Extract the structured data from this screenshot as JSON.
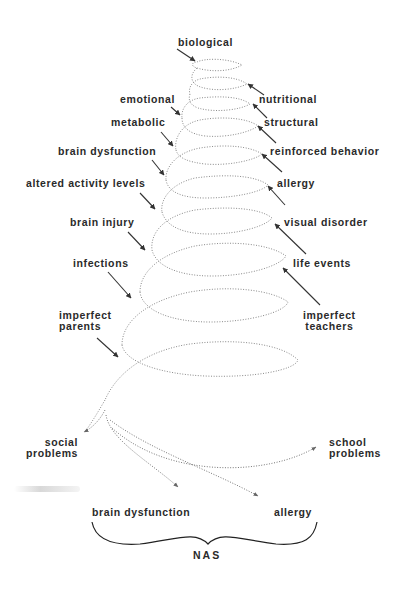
{
  "figure": {
    "type": "spiral-diagram",
    "converging_factors_left": [
      {
        "id": "biological",
        "label": "biological"
      },
      {
        "id": "emotional",
        "label": "emotional"
      },
      {
        "id": "metabolic",
        "label": "metabolic"
      },
      {
        "id": "brain-dysfunction-top",
        "label": "brain dysfunction"
      },
      {
        "id": "altered-activity",
        "label": "altered activity levels"
      },
      {
        "id": "brain-injury",
        "label": "brain injury"
      },
      {
        "id": "infections",
        "label": "infections"
      },
      {
        "id": "imperfect-parents",
        "label": "imperfect\nparents"
      }
    ],
    "converging_factors_right": [
      {
        "id": "nutritional",
        "label": "nutritional"
      },
      {
        "id": "structural",
        "label": "structural"
      },
      {
        "id": "reinforced-behavior",
        "label": "reinforced behavior"
      },
      {
        "id": "allergy-top",
        "label": "allergy"
      },
      {
        "id": "visual-disorder",
        "label": "visual disorder"
      },
      {
        "id": "life-events",
        "label": "life events"
      },
      {
        "id": "imperfect-teachers",
        "label": "imperfect\nteachers"
      }
    ],
    "outcomes": {
      "social": "social\nproblems",
      "school": "school\nproblems",
      "brain_dysfunction": "brain dysfunction",
      "allergy": "allergy"
    },
    "brace_label": "NAS",
    "colors": {
      "text": "#2a2a2a",
      "spiral": "#8a8a8a",
      "arrow": "#333333",
      "background": "#ffffff"
    }
  }
}
